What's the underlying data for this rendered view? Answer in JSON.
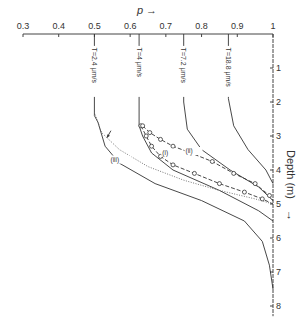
{
  "chart_data": {
    "type": "line",
    "title": "",
    "xlabel": "p",
    "ylabel": "Depth (m)",
    "xlim": [
      0.3,
      1.0
    ],
    "ylim": [
      0,
      8
    ],
    "x_axis_position": "top",
    "y_axis_position": "right",
    "y_inverted": true,
    "x_ticks": [
      "0.3",
      "0.4",
      "0.5",
      "0.6",
      "0.7",
      "0.8",
      "0.9",
      "1"
    ],
    "y_ticks": [
      "1",
      "2",
      "3",
      "4",
      "5",
      "6",
      "7",
      "8"
    ],
    "grid": false,
    "series": [
      {
        "name": "T=2.4 μm/s",
        "style": "solid",
        "points": [
          [
            0.5,
            0.0
          ],
          [
            0.5,
            2.4
          ],
          [
            0.51,
            2.6
          ],
          [
            0.53,
            3.3
          ],
          [
            0.57,
            3.8
          ],
          [
            0.67,
            4.4
          ],
          [
            0.8,
            4.9
          ],
          [
            0.92,
            5.5
          ],
          [
            0.97,
            6.1
          ],
          [
            0.99,
            6.8
          ],
          [
            1.0,
            7.5
          ]
        ]
      },
      {
        "name": "T=4 μm/s",
        "style": "solid",
        "points": [
          [
            0.625,
            0.0
          ],
          [
            0.625,
            2.7
          ],
          [
            0.635,
            3.0
          ],
          [
            0.66,
            3.5
          ],
          [
            0.72,
            4.0
          ],
          [
            0.85,
            4.6
          ],
          [
            0.96,
            5.2
          ],
          [
            1.0,
            5.5
          ]
        ]
      },
      {
        "name": "T=7.2 μm/s",
        "style": "solid",
        "points": [
          [
            0.75,
            0.0
          ],
          [
            0.75,
            2.0
          ],
          [
            0.76,
            2.8
          ],
          [
            0.8,
            3.4
          ],
          [
            0.88,
            4.0
          ],
          [
            0.96,
            4.5
          ],
          [
            1.0,
            4.9
          ]
        ]
      },
      {
        "name": "T=18.8 μm/s",
        "style": "solid",
        "points": [
          [
            0.875,
            0.0
          ],
          [
            0.875,
            1.9
          ],
          [
            0.89,
            2.7
          ],
          [
            0.93,
            3.4
          ],
          [
            0.98,
            4.0
          ],
          [
            1.0,
            4.4
          ]
        ]
      },
      {
        "name": "(i)",
        "style": "dashed-circles",
        "points": [
          [
            0.63,
            2.7
          ],
          [
            0.645,
            3.0
          ],
          [
            0.66,
            3.3
          ],
          [
            0.685,
            3.6
          ],
          [
            0.72,
            3.85
          ],
          [
            0.78,
            4.1
          ],
          [
            0.85,
            4.4
          ],
          [
            0.92,
            4.65
          ],
          [
            0.97,
            4.85
          ],
          [
            1.0,
            5.0
          ]
        ]
      },
      {
        "name": "(ii)",
        "style": "dashed-circles",
        "points": [
          [
            0.635,
            2.7
          ],
          [
            0.655,
            2.9
          ],
          [
            0.685,
            3.1
          ],
          [
            0.72,
            3.3
          ],
          [
            0.77,
            3.5
          ],
          [
            0.83,
            3.75
          ],
          [
            0.89,
            4.1
          ],
          [
            0.95,
            4.4
          ],
          [
            0.99,
            4.75
          ],
          [
            1.0,
            4.9
          ]
        ]
      },
      {
        "name": "(iii)",
        "style": "dotted",
        "points": [
          [
            0.5,
            2.3
          ],
          [
            0.52,
            2.9
          ],
          [
            0.57,
            3.4
          ],
          [
            0.65,
            3.9
          ],
          [
            0.75,
            4.3
          ],
          [
            0.85,
            4.6
          ],
          [
            0.95,
            4.85
          ],
          [
            1.0,
            5.0
          ]
        ]
      }
    ],
    "annotations": [
      {
        "text": "(i)",
        "x": 0.685,
        "y": 3.5
      },
      {
        "text": "(ii)",
        "x": 0.755,
        "y": 3.5
      },
      {
        "text": "(iii)",
        "x": 0.56,
        "y": 3.75
      },
      {
        "text": "arrow",
        "x": 0.535,
        "y": 2.9
      }
    ]
  },
  "labels": {
    "x_axis": "p",
    "y_axis": "Depth (m)",
    "arrow": "→",
    "down_arrow": "↓",
    "series_i": "(i)",
    "series_ii": "(ii)",
    "series_iii": "(iii)",
    "t1": "T=2.4 μm/s",
    "t2": "T=4 μm/s",
    "t3": "T=7.2 μm/s",
    "t4": "T=18.8 μm/s"
  }
}
